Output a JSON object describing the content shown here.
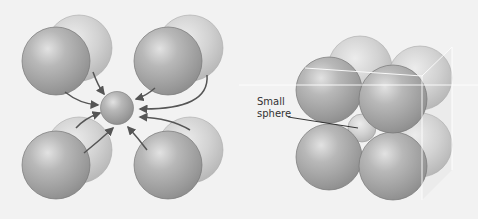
{
  "figure": {
    "left_panel": {
      "description": "Eight large spheres (four front, four back) arranged around a central small sphere, with arrows pointing toward it",
      "large_sphere_count": 8,
      "small_sphere_count": 1,
      "arrow_count": 8
    },
    "right_panel": {
      "description": "Eight large spheres packed in a cube with a small sphere in the center",
      "large_sphere_count": 8,
      "label": {
        "line1": "Small",
        "line2": "sphere"
      }
    },
    "colors": {
      "background": "#f2f2f2",
      "front_sphere": "#a8a8a8",
      "back_sphere": "#c8c8c8",
      "arrow": "#555555",
      "cube_edge": "#ffffff"
    }
  }
}
